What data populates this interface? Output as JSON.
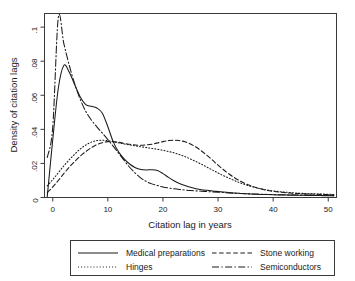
{
  "chart_data": {
    "type": "line",
    "title": "",
    "xlabel": "Citation lag in years",
    "ylabel": "Density of citation lags",
    "xlim": [
      -1.5,
      51.5
    ],
    "ylim": [
      0,
      0.108
    ],
    "xticks": [
      0,
      10,
      20,
      30,
      40,
      50
    ],
    "xtick_labels": [
      "0",
      "10",
      "20",
      "30",
      "40",
      "50"
    ],
    "yticks": [
      0,
      0.02,
      0.04,
      0.06,
      0.08,
      0.1
    ],
    "ytick_labels": [
      "0",
      ".02",
      ".04",
      ".06",
      ".08",
      ".1"
    ],
    "grid": false,
    "legend_position": "below-plot",
    "x": [
      -1,
      0,
      1,
      2,
      3,
      4,
      5,
      6,
      7,
      8,
      9,
      10,
      11,
      12,
      13,
      14,
      15,
      16,
      17,
      18,
      19,
      20,
      21,
      22,
      23,
      24,
      25,
      26,
      27,
      28,
      29,
      30,
      31,
      32,
      33,
      34,
      35,
      36,
      37,
      38,
      39,
      40,
      41,
      42,
      43,
      44,
      45,
      46,
      47,
      48,
      49,
      50,
      51
    ],
    "series": [
      {
        "name": "Medical preparations",
        "style": "solid",
        "values": [
          0.0005,
          0.034,
          0.064,
          0.0775,
          0.0735,
          0.066,
          0.059,
          0.0545,
          0.0535,
          0.0525,
          0.0495,
          0.0415,
          0.0325,
          0.0265,
          0.0225,
          0.0195,
          0.0175,
          0.0165,
          0.0162,
          0.0163,
          0.0158,
          0.014,
          0.0118,
          0.0098,
          0.0082,
          0.007,
          0.006,
          0.0052,
          0.0046,
          0.0042,
          0.0038,
          0.0035,
          0.0032,
          0.0029,
          0.0026,
          0.0024,
          0.0022,
          0.002,
          0.0019,
          0.0018,
          0.0017,
          0.0016,
          0.0015,
          0.0015,
          0.0014,
          0.0014,
          0.0013,
          0.0013,
          0.0012,
          0.0012,
          0.0011,
          0.0011,
          0.001
        ]
      },
      {
        "name": "Hinges",
        "style": "dotted",
        "values": [
          0.0068,
          0.0105,
          0.0145,
          0.0185,
          0.0222,
          0.0255,
          0.0285,
          0.0308,
          0.0325,
          0.0334,
          0.0336,
          0.0333,
          0.0327,
          0.032,
          0.0314,
          0.0308,
          0.0303,
          0.0298,
          0.0293,
          0.0288,
          0.0283,
          0.0277,
          0.027,
          0.0262,
          0.0252,
          0.024,
          0.0226,
          0.0211,
          0.0195,
          0.0178,
          0.0161,
          0.0144,
          0.0128,
          0.0113,
          0.0099,
          0.0086,
          0.0075,
          0.0065,
          0.0057,
          0.005,
          0.0044,
          0.0039,
          0.0035,
          0.0032,
          0.0029,
          0.0027,
          0.0025,
          0.0023,
          0.0022,
          0.0021,
          0.002,
          0.0019,
          0.0018
        ]
      },
      {
        "name": "Stone working",
        "style": "dashed",
        "values": [
          0.003,
          0.0062,
          0.01,
          0.014,
          0.0178,
          0.0212,
          0.0243,
          0.027,
          0.0292,
          0.031,
          0.0322,
          0.0328,
          0.0328,
          0.0324,
          0.0318,
          0.0312,
          0.0308,
          0.0307,
          0.0309,
          0.0313,
          0.032,
          0.0328,
          0.0334,
          0.0336,
          0.0334,
          0.0327,
          0.0314,
          0.0296,
          0.0273,
          0.0247,
          0.0219,
          0.019,
          0.0163,
          0.0138,
          0.0116,
          0.0097,
          0.0081,
          0.0068,
          0.0057,
          0.0048,
          0.0041,
          0.0036,
          0.0032,
          0.0029,
          0.0026,
          0.0024,
          0.0023,
          0.0021,
          0.002,
          0.0019,
          0.0018,
          0.0017,
          0.0016
        ]
      },
      {
        "name": "Semiconductors",
        "style": "dashdot",
        "values": [
          0.0235,
          0.0415,
          0.1055,
          0.0905,
          0.0775,
          0.0665,
          0.0575,
          0.0505,
          0.0455,
          0.0415,
          0.0378,
          0.034,
          0.03,
          0.0258,
          0.0216,
          0.0176,
          0.0142,
          0.0114,
          0.0094,
          0.008,
          0.007,
          0.0062,
          0.0056,
          0.0051,
          0.0047,
          0.0044,
          0.0041,
          0.0039,
          0.0037,
          0.0035,
          0.0033,
          0.0031,
          0.0029,
          0.0027,
          0.0025,
          0.0024,
          0.0022,
          0.0021,
          0.002,
          0.0019,
          0.0018,
          0.0017,
          0.0016,
          0.0016,
          0.0015,
          0.0015,
          0.0014,
          0.0014,
          0.0013,
          0.0013,
          0.0012,
          0.0012,
          0.0011
        ]
      }
    ]
  },
  "legend": {
    "entries": [
      {
        "label": "Medical preparations",
        "style": "solid"
      },
      {
        "label": "Stone working",
        "style": "dashed"
      },
      {
        "label": "Hinges",
        "style": "dotted"
      },
      {
        "label": "Semiconductors",
        "style": "dashdot"
      }
    ]
  }
}
